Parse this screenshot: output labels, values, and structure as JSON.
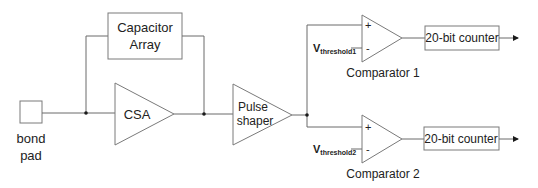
{
  "diagram": {
    "bond_pad": {
      "label_line1": "bond",
      "label_line2": "pad"
    },
    "capacitor_array": {
      "label_line1": "Capacitor",
      "label_line2": "Array"
    },
    "csa": {
      "label": "CSA"
    },
    "pulse_shaper": {
      "label_line1": "Pulse",
      "label_line2": "shaper"
    },
    "comparators": [
      {
        "label": "Comparator 1",
        "plus": "+",
        "minus": "-",
        "threshold_main": "V",
        "threshold_sub": "threshold1"
      },
      {
        "label": "Comparator 2",
        "plus": "+",
        "minus": "-",
        "threshold_main": "V",
        "threshold_sub": "threshold2"
      }
    ],
    "counters": [
      {
        "label": "20-bit counter"
      },
      {
        "label": "20-bit counter"
      }
    ]
  }
}
